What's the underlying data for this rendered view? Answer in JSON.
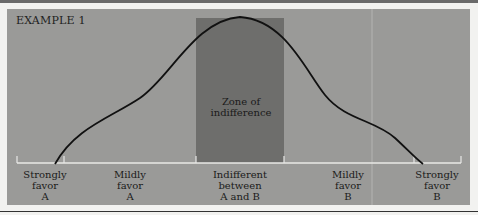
{
  "figure": {
    "title": "EXAMPLE 1",
    "zone_label": [
      "Zone of",
      "indifference"
    ],
    "axis_labels": [
      {
        "lines": [
          "Strongly",
          "favor",
          "A"
        ]
      },
      {
        "lines": [
          "Mildly",
          "favor",
          "A"
        ]
      },
      {
        "lines": [
          "Indifferent",
          "between",
          "A and B"
        ]
      },
      {
        "lines": [
          "Mildly",
          "favor",
          "B"
        ]
      },
      {
        "lines": [
          "Strongly",
          "favor",
          "B"
        ]
      }
    ],
    "colors": {
      "panel": "#9a9a98",
      "zone": "#6e6e6c",
      "curve": "#111111",
      "axis": "#e8e8e6"
    }
  }
}
